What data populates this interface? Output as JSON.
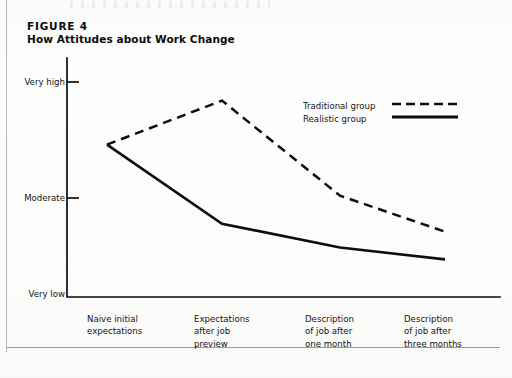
{
  "figure": {
    "number_label": "FIGURE  4",
    "title": "How Attitudes about Work Change"
  },
  "chart_data": {
    "type": "line",
    "title": "How Attitudes about Work Change",
    "subtitle": "FIGURE  4",
    "xlabel": "",
    "ylabel": "",
    "categories": [
      "Naive initial\nexpectations",
      "Expectations\nafter job\npreview",
      "Description\nof job after\none month",
      "Description\nof job after\nthree months"
    ],
    "ytick_labels": [
      "Very low",
      "Moderate",
      "Very high"
    ],
    "ytick_values": [
      0,
      50,
      100
    ],
    "ylim": [
      0,
      100
    ],
    "grid": false,
    "legend_position": "upper-right",
    "series": [
      {
        "name": "Traditional group",
        "style": "dashed",
        "color": "#0d0d0d",
        "values": [
          73,
          92,
          51,
          33
        ]
      },
      {
        "name": "Realistic group",
        "style": "solid",
        "color": "#0d0d0d",
        "values": [
          73,
          37,
          25,
          19
        ]
      }
    ]
  },
  "legend": {
    "items": [
      {
        "label": "Traditional group",
        "style": "dashed"
      },
      {
        "label": "Realistic group",
        "style": "solid"
      }
    ]
  },
  "colors": {
    "ink": "#0d0d0d",
    "paper": "#fdfdfc",
    "rule": "#9d9c99"
  }
}
